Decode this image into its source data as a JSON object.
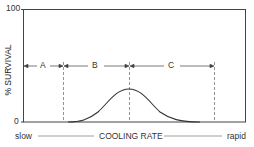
{
  "diagram": {
    "y_axis": {
      "label": "% SURVIVAL",
      "ticks": [
        "100",
        "0"
      ]
    },
    "x_axis": {
      "left_label": "slow",
      "center_label": "COOLING RATE",
      "right_label": "rapid"
    },
    "regions": [
      {
        "label": "A"
      },
      {
        "label": "B"
      },
      {
        "label": "C"
      }
    ],
    "curve": "bell-shaped survival curve peaking at boundary between regions B and C",
    "colors": {
      "line": "#333333",
      "dashed": "#777777",
      "background": "#ffffff"
    }
  }
}
